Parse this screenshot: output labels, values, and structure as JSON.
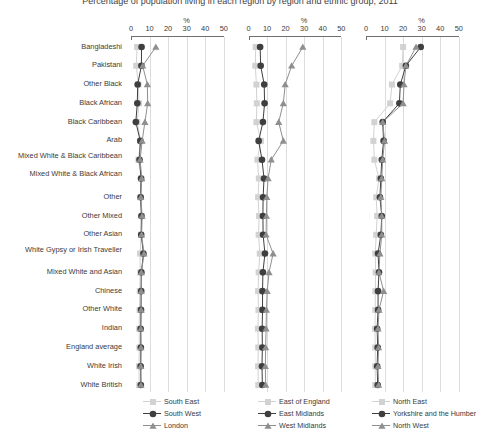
{
  "title": "Percentage of population living in each region by region and ethnic group, 2011",
  "chart_data": {
    "type": "line",
    "title": "Percentage of population living in each region by region and ethnic group, 2011",
    "xlabel": "%",
    "ylabel": "",
    "xlim": [
      0,
      50
    ],
    "xticks": [
      0,
      10,
      20,
      30,
      40,
      50
    ],
    "grid": true,
    "legend_position": "bottom",
    "orientation": "horizontal-categories",
    "axis_unit_label": "%",
    "categories": [
      "Bangladeshi",
      "Pakistani",
      "Other Black",
      "Black African",
      "Black Caribbean",
      "Arab",
      "Mixed White & Black Caribbean",
      "Mixed White & Black African",
      "Other",
      "Other Mixed",
      "Other Asian",
      "White Gypsy or Irish Traveller",
      "Mixed White and Asian",
      "Chinese",
      "Other White",
      "Indian",
      "England average",
      "White Irish",
      "White British"
    ],
    "panels": [
      {
        "id": "panel-1",
        "series": [
          {
            "name": "South East",
            "marker": "square",
            "color": "#d2d2d2",
            "values": [
              3.3,
              2.8,
              4.0,
              4.3,
              3.4,
              5.2,
              4.0,
              5.6,
              5.0,
              5.8,
              5.4,
              4.9,
              5.0,
              4.7,
              4.6,
              4.4,
              4.5,
              4.3,
              4.4
            ]
          },
          {
            "name": "South West",
            "marker": "circle",
            "color": "#3f3f3f",
            "values": [
              5.7,
              5.6,
              3.6,
              3.4,
              2.6,
              5.0,
              4.6,
              5.4,
              5.2,
              5.6,
              5.5,
              6.7,
              5.6,
              5.5,
              5.4,
              5.2,
              5.3,
              5.2,
              5.3
            ]
          },
          {
            "name": "London",
            "marker": "triangle",
            "color": "#8f8f8f",
            "values": [
              13.4,
              6.3,
              8.8,
              9.0,
              7.5,
              6.0,
              4.9,
              5.8,
              5.3,
              6.0,
              5.7,
              7.0,
              5.6,
              5.5,
              5.5,
              5.3,
              5.4,
              5.3,
              5.4
            ]
          }
        ]
      },
      {
        "id": "panel-2",
        "series": [
          {
            "name": "East of England",
            "marker": "square",
            "color": "#d2d2d2",
            "values": [
              3.6,
              3.4,
              4.0,
              4.2,
              4.0,
              6.4,
              4.5,
              5.3,
              4.9,
              5.4,
              5.2,
              5.8,
              5.2,
              4.9,
              5.1,
              4.8,
              5.0,
              4.9,
              5.0
            ]
          },
          {
            "name": "East Midlands",
            "marker": "circle",
            "color": "#3f3f3f",
            "values": [
              6.0,
              6.3,
              8.2,
              8.4,
              7.5,
              5.2,
              7.0,
              8.1,
              7.6,
              7.5,
              7.6,
              8.6,
              7.5,
              7.3,
              7.3,
              7.1,
              7.2,
              7.0,
              7.2
            ]
          },
          {
            "name": "West Midlands",
            "marker": "triangle",
            "color": "#8f8f8f",
            "values": [
              29.0,
              23.0,
              19.5,
              18.5,
              16.0,
              18.5,
              12.0,
              10.3,
              9.6,
              9.4,
              9.2,
              13.0,
              10.8,
              9.8,
              9.4,
              9.2,
              9.0,
              8.8,
              9.0
            ]
          }
        ]
      },
      {
        "id": "panel-3",
        "series": [
          {
            "name": "North East",
            "marker": "square",
            "color": "#d2d2d2",
            "values": [
              20.0,
              19.5,
              14.0,
              13.0,
              4.5,
              4.0,
              4.5,
              7.0,
              5.5,
              6.0,
              5.5,
              5.0,
              5.2,
              5.0,
              5.0,
              4.8,
              5.0,
              5.0,
              5.0
            ]
          },
          {
            "name": "Yorkshire and the Humber",
            "marker": "circle",
            "color": "#3f3f3f",
            "values": [
              29.5,
              21.5,
              18.5,
              18.0,
              9.0,
              9.5,
              8.5,
              8.0,
              7.5,
              8.5,
              8.0,
              6.5,
              7.0,
              6.5,
              6.5,
              6.0,
              6.3,
              6.0,
              6.3
            ]
          },
          {
            "name": "North West",
            "marker": "triangle",
            "color": "#8f8f8f",
            "values": [
              27.0,
              21.5,
              20.5,
              20.0,
              9.0,
              10.0,
              9.0,
              8.5,
              8.0,
              8.5,
              8.5,
              7.5,
              7.0,
              9.5,
              7.0,
              6.5,
              6.8,
              6.5,
              6.8
            ]
          }
        ]
      }
    ]
  },
  "legend": [
    {
      "panel": 0,
      "entries": [
        "South East",
        "South West",
        "London"
      ]
    },
    {
      "panel": 1,
      "entries": [
        "East of England",
        "East Midlands",
        "West Midlands"
      ]
    },
    {
      "panel": 2,
      "entries": [
        "North East",
        "Yorkshire and the Humber",
        "North West"
      ]
    }
  ]
}
